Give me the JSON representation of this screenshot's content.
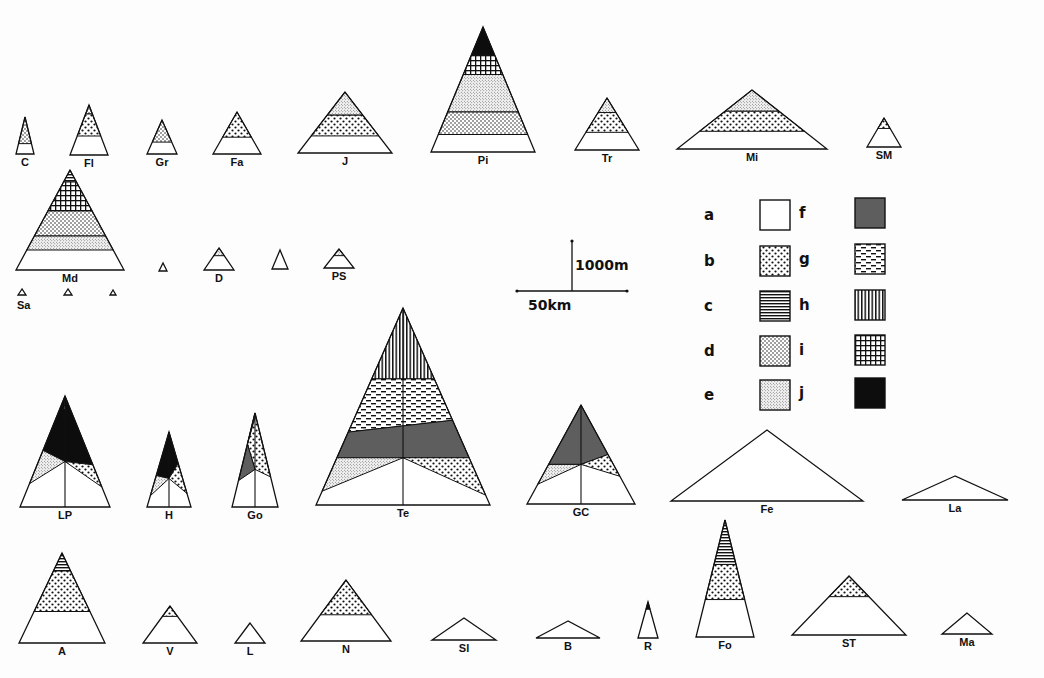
{
  "figure": {
    "type": "volcano-profile-triangles"
  },
  "patterns": {
    "a": {
      "label": "a",
      "fill": "blank"
    },
    "b": {
      "label": "b",
      "fill": "coarse-dots"
    },
    "c": {
      "label": "c",
      "fill": "horizontal-lines"
    },
    "d": {
      "label": "d",
      "fill": "medium-dots"
    },
    "e": {
      "label": "e",
      "fill": "fine-stipple"
    },
    "f": {
      "label": "f",
      "fill": "dark-grey"
    },
    "g": {
      "label": "g",
      "fill": "dashes"
    },
    "h": {
      "label": "h",
      "fill": "vertical-lines"
    },
    "i": {
      "label": "i",
      "fill": "grid"
    },
    "j": {
      "label": "j",
      "fill": "solid-black"
    }
  },
  "legend": {
    "items": [
      {
        "key": "a",
        "label": "a",
        "x": 760,
        "y": 200
      },
      {
        "key": "b",
        "label": "b",
        "x": 760,
        "y": 246
      },
      {
        "key": "c",
        "label": "c",
        "x": 760,
        "y": 291
      },
      {
        "key": "d",
        "label": "d",
        "x": 760,
        "y": 336
      },
      {
        "key": "e",
        "label": "e",
        "x": 760,
        "y": 380
      },
      {
        "key": "f",
        "label": "f",
        "x": 855,
        "y": 198
      },
      {
        "key": "g",
        "label": "g",
        "x": 855,
        "y": 244
      },
      {
        "key": "h",
        "label": "h",
        "x": 855,
        "y": 290
      },
      {
        "key": "i",
        "label": "i",
        "x": 855,
        "y": 335
      },
      {
        "key": "j",
        "label": "j",
        "x": 855,
        "y": 378
      }
    ]
  },
  "scale_bar": {
    "vertical_label": "1000m",
    "horizontal_label": "50km",
    "cx": 572,
    "cy": 291,
    "half_width": 55,
    "height": 50
  },
  "volcanoes": [
    {
      "label": "C",
      "apex": [
        25,
        117
      ],
      "base_y": 154,
      "half_base": 9,
      "bands": [
        {
          "key": "d",
          "from": 0,
          "to": 0.72
        }
      ]
    },
    {
      "label": "Fl",
      "apex": [
        89,
        105
      ],
      "base_y": 155,
      "half_base": 19,
      "bands": [
        {
          "key": "d",
          "from": 0,
          "to": 0.18
        },
        {
          "key": "b",
          "from": 0.18,
          "to": 0.62
        }
      ]
    },
    {
      "label": "Gr",
      "apex": [
        162,
        120
      ],
      "base_y": 154,
      "half_base": 15,
      "bands": [
        {
          "key": "d",
          "from": 0,
          "to": 0.65
        }
      ]
    },
    {
      "label": "Fa",
      "apex": [
        237,
        112
      ],
      "base_y": 154,
      "half_base": 24,
      "bands": [
        {
          "key": "b",
          "from": 0,
          "to": 0.6
        }
      ]
    },
    {
      "label": "J",
      "apex": [
        345,
        92
      ],
      "base_y": 153,
      "half_base": 47,
      "bands": [
        {
          "key": "e",
          "from": 0,
          "to": 0.38
        },
        {
          "key": "b",
          "from": 0.38,
          "to": 0.72
        }
      ]
    },
    {
      "label": "Pi",
      "apex": [
        483,
        27
      ],
      "base_y": 152,
      "half_base": 52,
      "bands": [
        {
          "key": "j",
          "from": 0,
          "to": 0.22
        },
        {
          "key": "i",
          "from": 0.22,
          "to": 0.38
        },
        {
          "key": "e",
          "from": 0.38,
          "to": 0.68
        },
        {
          "key": "d",
          "from": 0.68,
          "to": 0.86
        }
      ]
    },
    {
      "label": "Tr",
      "apex": [
        607,
        98
      ],
      "base_y": 150,
      "half_base": 32,
      "bands": [
        {
          "key": "e",
          "from": 0,
          "to": 0.28
        },
        {
          "key": "b",
          "from": 0.28,
          "to": 0.66
        }
      ]
    },
    {
      "label": "Mi",
      "apex": [
        752,
        90
      ],
      "base_y": 149,
      "half_base": 75,
      "bands": [
        {
          "key": "e",
          "from": 0,
          "to": 0.36
        },
        {
          "key": "b",
          "from": 0.36,
          "to": 0.7
        }
      ]
    },
    {
      "label": "SM",
      "apex": [
        884,
        118
      ],
      "base_y": 147,
      "half_base": 17,
      "bands": [
        {
          "key": "b",
          "from": 0,
          "to": 0.36
        }
      ]
    },
    {
      "label": "Md",
      "apex": [
        70,
        170
      ],
      "base_y": 270,
      "half_base": 54,
      "bands": [
        {
          "key": "c",
          "from": 0,
          "to": 0.12
        },
        {
          "key": "i",
          "from": 0.12,
          "to": 0.41
        },
        {
          "key": "d",
          "from": 0.41,
          "to": 0.66
        },
        {
          "key": "e",
          "from": 0.66,
          "to": 0.8
        }
      ]
    },
    {
      "label": "",
      "apex": [
        163,
        263
      ],
      "base_y": 271,
      "half_base": 4,
      "bands": []
    },
    {
      "label": "D",
      "apex": [
        219,
        248
      ],
      "base_y": 270,
      "half_base": 15,
      "bands": [
        {
          "key": "e",
          "from": 0,
          "to": 0.35
        }
      ]
    },
    {
      "label": "",
      "apex": [
        280,
        250
      ],
      "base_y": 269,
      "half_base": 8,
      "bands": []
    },
    {
      "label": "PS",
      "apex": [
        339,
        249
      ],
      "base_y": 268,
      "half_base": 15,
      "bands": [
        {
          "key": "e",
          "from": 0,
          "to": 0.35
        }
      ]
    },
    {
      "label": "Sa",
      "apex": [
        22,
        289
      ],
      "base_y": 295,
      "half_base": 4,
      "bands": []
    },
    {
      "label": "",
      "apex": [
        68,
        289
      ],
      "base_y": 295,
      "half_base": 4,
      "bands": []
    },
    {
      "label": "",
      "apex": [
        113,
        290
      ],
      "base_y": 295,
      "half_base": 3,
      "bands": []
    },
    {
      "label": "LP",
      "apex": [
        65,
        396
      ],
      "base_y": 507,
      "half_base": 45,
      "center_line": true,
      "custom": "LP"
    },
    {
      "label": "H",
      "apex": [
        169,
        432
      ],
      "base_y": 507,
      "half_base": 22,
      "center_line": true,
      "custom": "H"
    },
    {
      "label": "Go",
      "apex": [
        255,
        413
      ],
      "base_y": 507,
      "half_base": 23,
      "center_line": true,
      "custom": "Go"
    },
    {
      "label": "Te",
      "apex": [
        403,
        308
      ],
      "base_y": 505,
      "half_base": 87,
      "center_line": true,
      "custom": "Te"
    },
    {
      "label": "GC",
      "apex": [
        581,
        405
      ],
      "base_y": 504,
      "half_base": 54,
      "center_line": true,
      "custom": "GC"
    },
    {
      "label": "Fe",
      "apex": [
        767,
        430
      ],
      "base_y": 501,
      "half_base": 96,
      "bands": []
    },
    {
      "label": "La",
      "apex": [
        955,
        476
      ],
      "base_y": 500,
      "half_base": 53,
      "bands": []
    },
    {
      "label": "A",
      "apex": [
        62,
        553
      ],
      "base_y": 643,
      "half_base": 43,
      "bands": [
        {
          "key": "c",
          "from": 0,
          "to": 0.2
        },
        {
          "key": "b",
          "from": 0.2,
          "to": 0.65
        }
      ]
    },
    {
      "label": "V",
      "apex": [
        170,
        606
      ],
      "base_y": 643,
      "half_base": 27,
      "bands": [
        {
          "key": "b",
          "from": 0,
          "to": 0.28
        }
      ]
    },
    {
      "label": "L",
      "apex": [
        250,
        623
      ],
      "base_y": 643,
      "half_base": 15,
      "bands": []
    },
    {
      "label": "N",
      "apex": [
        346,
        580
      ],
      "base_y": 641,
      "half_base": 45,
      "bands": [
        {
          "key": "b",
          "from": 0,
          "to": 0.57
        }
      ]
    },
    {
      "label": "Sl",
      "apex": [
        464,
        618
      ],
      "base_y": 640,
      "half_base": 32,
      "bands": []
    },
    {
      "label": "B",
      "apex": [
        568,
        621
      ],
      "base_y": 638,
      "half_base": 32,
      "bands": []
    },
    {
      "label": "R",
      "apex": [
        648,
        602
      ],
      "base_y": 638,
      "half_base": 10,
      "bands": [
        {
          "key": "j",
          "from": 0,
          "to": 0.2
        }
      ]
    },
    {
      "label": "Fo",
      "apex": [
        725,
        520
      ],
      "base_y": 637,
      "half_base": 29,
      "bands": [
        {
          "key": "c",
          "from": 0,
          "to": 0.38
        },
        {
          "key": "b",
          "from": 0.38,
          "to": 0.68
        }
      ]
    },
    {
      "label": "ST",
      "apex": [
        849,
        576
      ],
      "base_y": 635,
      "half_base": 57,
      "bands": [
        {
          "key": "b",
          "from": 0,
          "to": 0.35
        }
      ]
    },
    {
      "label": "Ma",
      "apex": [
        967,
        613
      ],
      "base_y": 634,
      "half_base": 25,
      "bands": []
    }
  ]
}
